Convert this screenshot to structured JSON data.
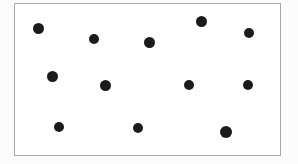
{
  "figure": {
    "dot_count": 12,
    "canvas": {
      "width": 298,
      "height": 164
    },
    "frame": {
      "x": 14,
      "y": 3,
      "width": 267,
      "height": 153,
      "border_color": "#6f6f6f",
      "border_width": 1.5,
      "fill_color": "#ffffff"
    },
    "background_color": "#fcfcfc",
    "dot_color": "#1b1b1b"
  },
  "chart_data": {
    "type": "scatter",
    "title": "",
    "xlabel": "",
    "ylabel": "",
    "xlim": [
      14,
      281
    ],
    "ylim": [
      3,
      156
    ],
    "grid": false,
    "legend": null,
    "axis_visible": false,
    "tick_labels": {
      "x": [],
      "y": []
    },
    "marker": {
      "shape": "circle",
      "color": "#1b1b1b",
      "size_px": 11
    },
    "n_points": 12,
    "x": [
      38,
      94,
      149,
      201,
      249,
      52,
      105,
      189,
      248,
      59,
      138,
      226
    ],
    "y": [
      28,
      39,
      42,
      21,
      33,
      76,
      85,
      85,
      85,
      127,
      128,
      132
    ],
    "points": [
      {
        "id": 1,
        "x": 38,
        "y": 28,
        "r": 5.5
      },
      {
        "id": 2,
        "x": 94,
        "y": 39,
        "r": 5.0
      },
      {
        "id": 3,
        "x": 149,
        "y": 42,
        "r": 5.5
      },
      {
        "id": 4,
        "x": 201,
        "y": 21,
        "r": 5.5
      },
      {
        "id": 5,
        "x": 249,
        "y": 33,
        "r": 5.0
      },
      {
        "id": 6,
        "x": 52,
        "y": 76,
        "r": 5.5
      },
      {
        "id": 7,
        "x": 105,
        "y": 85,
        "r": 5.5
      },
      {
        "id": 8,
        "x": 189,
        "y": 85,
        "r": 5.0
      },
      {
        "id": 9,
        "x": 248,
        "y": 85,
        "r": 5.0
      },
      {
        "id": 10,
        "x": 59,
        "y": 127,
        "r": 5.0
      },
      {
        "id": 11,
        "x": 138,
        "y": 128,
        "r": 5.0
      },
      {
        "id": 12,
        "x": 226,
        "y": 132,
        "r": 6.0
      }
    ]
  }
}
